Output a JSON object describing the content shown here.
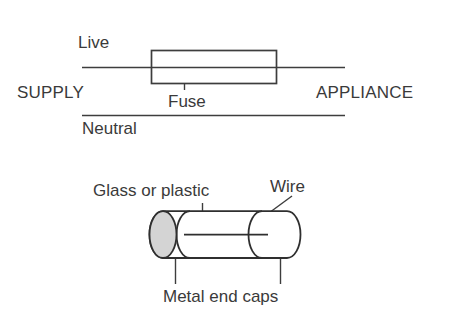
{
  "figure": {
    "background_color": "#ffffff",
    "line_color": "#3d3d3d",
    "text_color": "#3a3a3a",
    "end_face_fill": "#d4d4d4"
  },
  "circuit_diagram": {
    "labels": {
      "live": "Live",
      "supply": "SUPPLY",
      "appliance": "APPLIANCE",
      "fuse": "Fuse",
      "neutral": "Neutral"
    }
  },
  "fuse_construction": {
    "labels": {
      "glass_or_plastic": "Glass or plastic",
      "wire": "Wire",
      "metal_end_caps": "Metal end caps"
    }
  }
}
